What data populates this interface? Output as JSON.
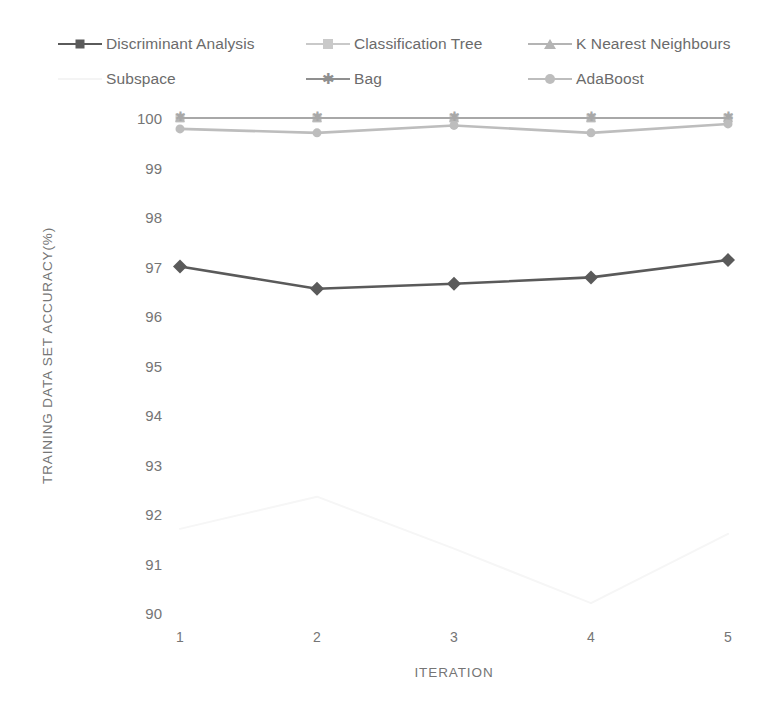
{
  "legend": {
    "rows": [
      [
        {
          "name": "Discriminant Analysis",
          "marker": "diamond",
          "color": "#5a5a5a"
        },
        {
          "name": "Classification Tree",
          "marker": "square",
          "color": "#c9c9c9"
        },
        {
          "name": "K Nearest Neighbours",
          "marker": "triangle",
          "color": "#b4b4b4"
        }
      ],
      [
        {
          "name": "Subspace",
          "marker": "none",
          "color": "#f4f4f4"
        },
        {
          "name": "Bag",
          "marker": "star",
          "color": "#8f8f8f"
        },
        {
          "name": "AdaBoost",
          "marker": "circle",
          "color": "#bdbdbd"
        }
      ]
    ]
  },
  "axes": {
    "y_title": "TRAINING DATA SET ACCURACY(%)",
    "x_title": "ITERATION",
    "y_ticks": [
      "100",
      "99",
      "98",
      "97",
      "96",
      "95",
      "94",
      "93",
      "92",
      "91",
      "90"
    ],
    "x_ticks": [
      "1",
      "2",
      "3",
      "4",
      "5"
    ]
  },
  "chart_data": {
    "type": "line",
    "title": "",
    "xlabel": "ITERATION",
    "ylabel": "TRAINING DATA SET ACCURACY(%)",
    "x": [
      1,
      2,
      3,
      4,
      5
    ],
    "categories": [
      "1",
      "2",
      "3",
      "4",
      "5"
    ],
    "ylim": [
      90,
      100
    ],
    "xlim": [
      1,
      5
    ],
    "yticks": [
      90,
      91,
      92,
      93,
      94,
      95,
      96,
      97,
      98,
      99,
      100
    ],
    "grid": false,
    "legend_position": "top",
    "series": [
      {
        "name": "Discriminant Analysis",
        "values": [
          97.0,
          96.55,
          96.65,
          96.78,
          97.13
        ],
        "color": "#5a5a5a",
        "marker": "diamond",
        "line_width": 2.6,
        "marker_size": 7
      },
      {
        "name": "Classification Tree",
        "values": [
          100.0,
          100.0,
          100.0,
          100.0,
          100.0
        ],
        "color": "#c9c9c9",
        "marker": "square",
        "line_width": 2.2,
        "marker_size": 9
      },
      {
        "name": "K Nearest Neighbours",
        "values": [
          100.0,
          100.0,
          100.0,
          100.0,
          100.0
        ],
        "color": "#b4b4b4",
        "marker": "triangle",
        "line_width": 2.2,
        "marker_size": 8
      },
      {
        "name": "Subspace",
        "values": [
          91.7,
          92.35,
          91.3,
          90.2,
          91.6
        ],
        "color": "#f6f6f6",
        "marker": "none",
        "line_width": 2.0,
        "marker_size": 0
      },
      {
        "name": "Bag",
        "values": [
          100.0,
          100.0,
          100.0,
          100.0,
          100.0
        ],
        "color": "#a8a8a8",
        "marker": "star",
        "line_width": 2.0,
        "marker_size": 7
      },
      {
        "name": "AdaBoost",
        "values": [
          99.78,
          99.7,
          99.85,
          99.7,
          99.88
        ],
        "color": "#bdbdbd",
        "marker": "circle",
        "line_width": 2.6,
        "marker_size": 9
      }
    ]
  },
  "geometry": {
    "plot_left": 180,
    "plot_right": 728,
    "plot_top": 118,
    "plot_bottom": 613
  }
}
